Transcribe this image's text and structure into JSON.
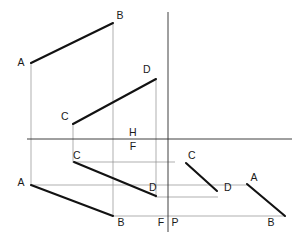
{
  "drawing": {
    "title": "Orthographic projection of two lines AB and CD",
    "width": 306,
    "height": 244,
    "background_color": "#ffffff",
    "object_line_color": "#121212",
    "axis_line_color": "#2a2a2a",
    "projector_line_color": "#8d8d8d",
    "label_color": "#1a1a1a"
  },
  "labels": {
    "ab_top_a": "A",
    "ab_top_b": "B",
    "cd_top_c": "C",
    "cd_top_d": "D",
    "plane_h": "H",
    "plane_f": "F",
    "cd_front_c": "C",
    "cd_front_d": "D",
    "ab_front_a": "A",
    "ab_front_b": "B",
    "cd_profile_c": "C",
    "cd_profile_d": "D",
    "ab_profile_a": "A",
    "ab_profile_b": "B",
    "axis_f": "F",
    "axis_p": "P"
  },
  "label_positions": {
    "ab_top_a": {
      "x": 21,
      "y": 63
    },
    "ab_top_b": {
      "x": 120,
      "y": 16
    },
    "cd_top_c": {
      "x": 65,
      "y": 117
    },
    "cd_top_d": {
      "x": 147,
      "y": 70
    },
    "plane_h": {
      "x": 133,
      "y": 133
    },
    "plane_f": {
      "x": 133,
      "y": 146
    },
    "cd_front_c": {
      "x": 77,
      "y": 156
    },
    "cd_front_d": {
      "x": 153,
      "y": 188
    },
    "ab_front_a": {
      "x": 21,
      "y": 183
    },
    "ab_front_b": {
      "x": 121,
      "y": 223
    },
    "cd_profile_c": {
      "x": 192,
      "y": 156
    },
    "cd_profile_d": {
      "x": 228,
      "y": 188
    },
    "ab_profile_a": {
      "x": 254,
      "y": 178
    },
    "ab_profile_b": {
      "x": 271,
      "y": 223
    },
    "axis_f": {
      "x": 161,
      "y": 223
    },
    "axis_p": {
      "x": 175,
      "y": 223
    }
  },
  "geometry": {
    "axes": [
      {
        "name": "ground-line-horizontal",
        "x1": 27,
        "y1": 139,
        "x2": 292,
        "y2": 139
      },
      {
        "name": "profile-axis-vertical",
        "x1": 168,
        "y1": 12,
        "x2": 168,
        "y2": 232
      }
    ],
    "object_segments": [
      {
        "name": "segment-ab-top-view",
        "x1": 31,
        "y1": 63,
        "x2": 113,
        "y2": 23
      },
      {
        "name": "segment-cd-top-view",
        "x1": 73,
        "y1": 124,
        "x2": 156,
        "y2": 79
      },
      {
        "name": "segment-cd-front-view",
        "x1": 74,
        "y1": 162,
        "x2": 156,
        "y2": 196
      },
      {
        "name": "segment-ab-front-view",
        "x1": 31,
        "y1": 185,
        "x2": 113,
        "y2": 216
      },
      {
        "name": "segment-cd-profile-view",
        "x1": 186,
        "y1": 163,
        "x2": 217,
        "y2": 191
      },
      {
        "name": "segment-ab-profile-view",
        "x1": 247,
        "y1": 184,
        "x2": 285,
        "y2": 216
      }
    ],
    "projector_segments": [
      {
        "name": "projector-a-vertical",
        "x1": 31,
        "y1": 63,
        "x2": 31,
        "y2": 186
      },
      {
        "name": "projector-b-vertical",
        "x1": 113,
        "y1": 23,
        "x2": 113,
        "y2": 216
      },
      {
        "name": "projector-c-vertical",
        "x1": 73,
        "y1": 124,
        "x2": 73,
        "y2": 163
      },
      {
        "name": "projector-d-vertical",
        "x1": 156,
        "y1": 79,
        "x2": 156,
        "y2": 197
      },
      {
        "name": "projector-c-horizontal",
        "x1": 74,
        "y1": 162,
        "x2": 175,
        "y2": 162
      },
      {
        "name": "projector-a-horizontal",
        "x1": 31,
        "y1": 185,
        "x2": 249,
        "y2": 185
      },
      {
        "name": "projector-d-horizontal",
        "x1": 155,
        "y1": 197,
        "x2": 218,
        "y2": 197
      },
      {
        "name": "projector-b-horizontal",
        "x1": 113,
        "y1": 216,
        "x2": 285,
        "y2": 216
      }
    ]
  }
}
